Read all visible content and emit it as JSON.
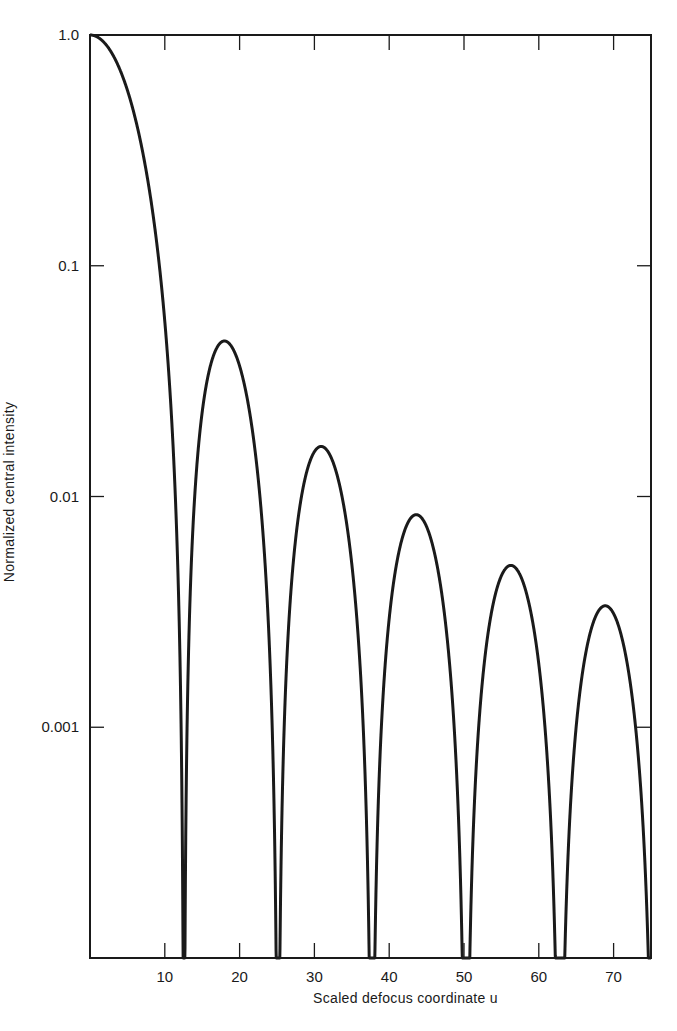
{
  "chart_data": {
    "type": "line",
    "title": "",
    "xlabel": "Scaled defocus coordinate u",
    "ylabel": "Normalized central intensity",
    "xlim": [
      0,
      75
    ],
    "ylim": [
      0.0001,
      1.0
    ],
    "yscale": "log",
    "grid": false,
    "legend": null,
    "x_ticks": [
      10,
      20,
      30,
      40,
      50,
      60,
      70
    ],
    "x_tick_labels": [
      "10",
      "20",
      "30",
      "40",
      "50",
      "60",
      "70"
    ],
    "y_ticks": [
      1.0,
      0.1,
      0.01,
      0.001
    ],
    "y_tick_labels": [
      "1.0",
      "0.1",
      "0.01",
      "0.001"
    ],
    "function": "[sin(u/4)/(u/4)]^2",
    "series": [
      {
        "name": "central intensity",
        "color": "#1a1a1a",
        "key_points": [
          {
            "u": 0,
            "I": 1.0
          },
          {
            "u": 12.57,
            "I": 0
          },
          {
            "u": 18.0,
            "I": 0.047
          },
          {
            "u": 25.13,
            "I": 0
          },
          {
            "u": 30.9,
            "I": 0.016
          },
          {
            "u": 37.7,
            "I": 0
          },
          {
            "u": 43.6,
            "I": 0.0083
          },
          {
            "u": 50.27,
            "I": 0
          },
          {
            "u": 56.1,
            "I": 0.005
          },
          {
            "u": 62.83,
            "I": 0
          },
          {
            "u": 68.6,
            "I": 0.0034
          },
          {
            "u": 75.0,
            "I": 0
          }
        ]
      }
    ]
  },
  "layout": {
    "plot_left": 90,
    "plot_top": 35,
    "plot_right": 651,
    "plot_bottom": 958
  }
}
